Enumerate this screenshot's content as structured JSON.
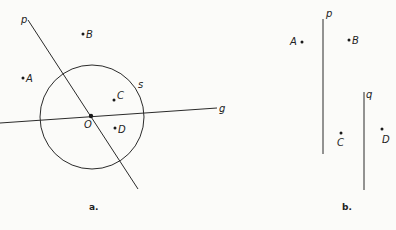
{
  "figure_a": {
    "caption": "a.",
    "line_p": {
      "label": "p",
      "x1": 28,
      "y1": 20,
      "x2": 138,
      "y2": 189,
      "lx": 21,
      "ly": 23
    },
    "line_g": {
      "label": "g",
      "x1": 0,
      "y1": 123,
      "x2": 217,
      "y2": 108,
      "lx": 219,
      "ly": 112
    },
    "circle_s": {
      "label": "s",
      "cx": 92,
      "cy": 117,
      "r": 52,
      "lx": 138,
      "ly": 88
    },
    "center_O": {
      "label": "O",
      "x": 91,
      "y": 116,
      "lx": 84,
      "ly": 128
    },
    "points": [
      {
        "label": "A",
        "x": 23,
        "y": 78,
        "lx": 26,
        "ly": 82
      },
      {
        "label": "B",
        "x": 83,
        "y": 34,
        "lx": 86,
        "ly": 38
      },
      {
        "label": "C",
        "x": 114,
        "y": 100,
        "lx": 117,
        "ly": 99
      },
      {
        "label": "D",
        "x": 115,
        "y": 128,
        "lx": 118,
        "ly": 133
      }
    ]
  },
  "figure_b": {
    "caption": "b.",
    "line_p": {
      "label": "p",
      "x1": 323,
      "y1": 19,
      "x2": 323,
      "y2": 154,
      "lx": 326,
      "ly": 17
    },
    "line_q": {
      "label": "q",
      "x1": 364,
      "y1": 92,
      "x2": 364,
      "y2": 190,
      "lx": 366,
      "ly": 98
    },
    "points": [
      {
        "label": "A",
        "x": 302,
        "y": 42,
        "lx": 290,
        "ly": 45
      },
      {
        "label": "B",
        "x": 349,
        "y": 40,
        "lx": 352,
        "ly": 44
      },
      {
        "label": "C",
        "x": 341,
        "y": 133,
        "lx": 337,
        "ly": 146
      },
      {
        "label": "D",
        "x": 382,
        "y": 129,
        "lx": 382,
        "ly": 143
      }
    ]
  }
}
